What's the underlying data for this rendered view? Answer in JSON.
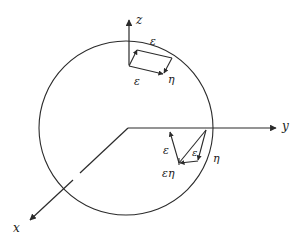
{
  "figure": {
    "title": "",
    "kind": "geometric-diagram",
    "background_color": "#ffffff",
    "stroke_color": "#2b2b2b",
    "text_color": "#1a1a1a",
    "canvas": {
      "width": 308,
      "height": 245
    }
  },
  "axes": [
    {
      "id": "z",
      "label": "z",
      "direction": "up",
      "arrow": true
    },
    {
      "id": "y",
      "label": "y",
      "direction": "right",
      "arrow": true
    },
    {
      "id": "x",
      "label": "x",
      "direction": "down-left",
      "arrow": true
    }
  ],
  "circle": {
    "name": "sphere-outline",
    "center": {
      "x": 126,
      "y": 128
    },
    "radius": 87
  },
  "top_patch": {
    "name": "top-parallelogram",
    "labels": [
      {
        "id": "top-eps-upper",
        "text": "ε"
      },
      {
        "id": "top-eps-lower",
        "text": "ε"
      },
      {
        "id": "top-eta",
        "text": "η"
      }
    ]
  },
  "right_patch": {
    "name": "right-parallelogram",
    "labels": [
      {
        "id": "right-eps-left",
        "text": "ε"
      },
      {
        "id": "right-eps-right",
        "text": "ε"
      },
      {
        "id": "right-epseta",
        "text": "εη"
      },
      {
        "id": "right-eta",
        "text": "η"
      }
    ]
  },
  "labels": {
    "axis_z": "z",
    "axis_y": "y",
    "axis_x": "x",
    "top_eps_upper": "ε",
    "top_eps_lower": "ε",
    "top_eta": "η",
    "right_eps_left": "ε",
    "right_eps_right": "ε",
    "right_epseta": "εη",
    "right_eta": "η"
  }
}
